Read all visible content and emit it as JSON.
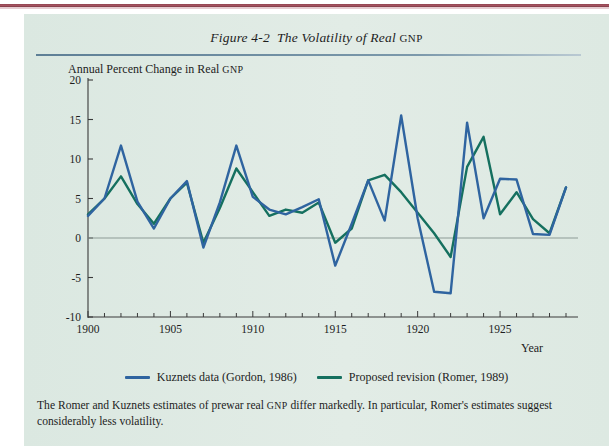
{
  "figure": {
    "number": "Figure 4-2",
    "title_text": "The Volatility of Real ",
    "title_smallcaps": "GNP",
    "caption": "The Romer and Kuznets estimates of prewar real GNP differ markedly. In particular, Romer's estimates suggest considerably less volatility."
  },
  "colors": {
    "panel_bg": "#dde9e3",
    "kuznets": "#2f64a0",
    "romer": "#15705f",
    "axis": "#3a3a3a",
    "zero_line": "#8d9b96",
    "title_rule": "#5e7f96",
    "top_rule": "#8e4350"
  },
  "legend": {
    "position": "bottom-center",
    "entries": [
      {
        "label": "Kuznets data (Gordon, 1986)",
        "color": "#2f64a0"
      },
      {
        "label": "Proposed revision (Romer, 1989)",
        "color": "#15705f"
      }
    ]
  },
  "chart_data": {
    "type": "line",
    "subtitle": "",
    "xlabel": "Year",
    "ylabel": "Annual Percent Change in Real GNP",
    "ylabel_prefix": "Annual Percent Change in Real ",
    "ylabel_smallcaps": "GNP",
    "xlim": [
      1900,
      1929
    ],
    "ylim": [
      -10,
      20
    ],
    "yticks": [
      -10,
      -5,
      0,
      5,
      10,
      15,
      20
    ],
    "ytick_labels": [
      "-10",
      "-5",
      "0",
      "5",
      "10",
      "15",
      "20"
    ],
    "xticks": [
      1900,
      1905,
      1910,
      1915,
      1920,
      1925
    ],
    "xtick_labels": [
      "1900",
      "1905",
      "1910",
      "1915",
      "1920",
      "1925"
    ],
    "x_minor_tick_step": 1,
    "grid": false,
    "zero_line": true,
    "x": [
      1900,
      1901,
      1902,
      1903,
      1904,
      1905,
      1906,
      1907,
      1908,
      1909,
      1910,
      1911,
      1912,
      1913,
      1914,
      1915,
      1916,
      1917,
      1918,
      1919,
      1920,
      1921,
      1922,
      1923,
      1924,
      1925,
      1926,
      1927,
      1928,
      1929
    ],
    "series": [
      {
        "name": "Kuznets data (Gordon, 1986)",
        "color": "#2f64a0",
        "values": [
          2.8,
          5.0,
          11.7,
          4.6,
          1.2,
          5.0,
          7.2,
          -1.2,
          4.5,
          11.7,
          5.2,
          3.6,
          3.0,
          3.9,
          4.9,
          -3.5,
          1.8,
          7.3,
          2.2,
          15.5,
          2.5,
          -6.8,
          -7.0,
          14.6,
          2.5,
          7.5,
          7.4,
          0.5,
          0.4,
          6.4
        ]
      },
      {
        "name": "Proposed revision (Romer, 1989)",
        "color": "#15705f",
        "values": [
          3.0,
          5.0,
          7.8,
          4.3,
          1.8,
          5.0,
          7.0,
          -0.6,
          3.8,
          8.8,
          5.8,
          2.8,
          3.6,
          3.2,
          4.5,
          -0.6,
          1.2,
          7.3,
          8.0,
          5.8,
          3.2,
          0.6,
          -2.4,
          9.0,
          12.8,
          3.0,
          5.8,
          2.4,
          0.6,
          6.4
        ]
      }
    ],
    "annotations": [
      {
        "text": "Kuznets series is markedly more volatile than Romer series",
        "kind": "note"
      }
    ]
  }
}
